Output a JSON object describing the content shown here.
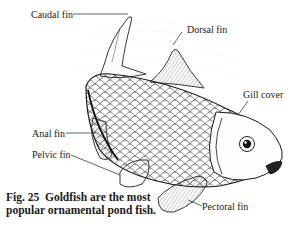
{
  "figure": {
    "labels": {
      "caudal_fin": "Caudal fin",
      "dorsal_fin": "Dorsal fin",
      "gill_cover": "Gill cover",
      "anal_fin": "Anal fin",
      "pelvic_fin": "Pelvic fin",
      "pectoral_fin": "Pectoral fin"
    },
    "caption": {
      "number": "Fig. 25",
      "text": "Goldfish are the most popular ornamental pond fish."
    },
    "colors": {
      "ink": "#1a1a1a",
      "background": "#ffffff"
    }
  }
}
